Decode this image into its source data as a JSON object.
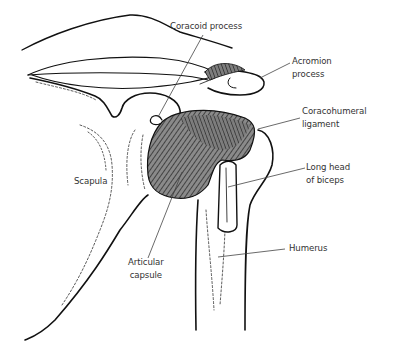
{
  "diagram": {
    "colors": {
      "background": "#ffffff",
      "ink": "#111111",
      "label_text": "#333333",
      "leader_line": "#444444",
      "ligament_fill": "#7a7a7a"
    },
    "labels": [
      {
        "id": "coracoid-process",
        "text": "Coracoid process",
        "x": 170,
        "y": 20
      },
      {
        "id": "acromion-process",
        "text": "Acromion\nprocess",
        "x": 292,
        "y": 55
      },
      {
        "id": "coracohumeral-ligament",
        "text": "Coracohumeral\nligament",
        "x": 302,
        "y": 105
      },
      {
        "id": "long-head-of-biceps",
        "text": "Long head\nof biceps",
        "x": 306,
        "y": 161
      },
      {
        "id": "scapula",
        "text": "Scapula",
        "x": 74,
        "y": 175
      },
      {
        "id": "humerus",
        "text": "Humerus",
        "x": 289,
        "y": 242
      },
      {
        "id": "articular-capsule",
        "text": "Articular\ncapsule",
        "x": 128,
        "y": 256
      }
    ]
  }
}
